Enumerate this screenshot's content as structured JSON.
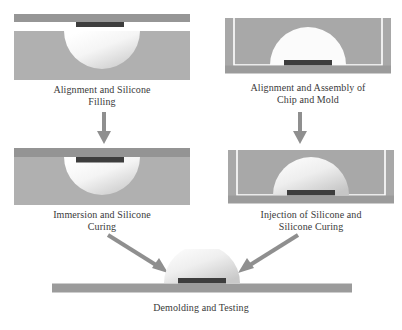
{
  "figure": {
    "type": "process-flow-diagram",
    "background_color": "#ffffff"
  },
  "palette": {
    "mold_gray": "#a6a6a6",
    "block_gray": "#b3b3b3",
    "bar_dark_gray": "#969696",
    "substrate_gray": "#9e9e9e",
    "chip_dark": "#3d3d3d",
    "lens_light": "#f2f2f2",
    "lens_shadow": "#cfcfcf",
    "outline_white": "#ffffff",
    "arrow_gray": "#8c8c8c",
    "caption_color": "#3a3a3a"
  },
  "steps": [
    {
      "id": "step-1",
      "position": "top-left",
      "caption_line1": "Alignment and Silicone",
      "caption_line2": "Filling",
      "elements": [
        "top-bar",
        "chip",
        "mold-block",
        "silicone-dome-cavity"
      ]
    },
    {
      "id": "step-2",
      "position": "top-right",
      "caption_line1": "Alignment and Assembly of",
      "caption_line2": "Chip and Mold",
      "elements": [
        "mold-block",
        "white-frame-outline",
        "dome-cavity",
        "chip",
        "substrate-bar"
      ]
    },
    {
      "id": "step-3",
      "position": "bottom-left",
      "caption_line1": "Immersion and Silicone",
      "caption_line2": "Curing",
      "elements": [
        "top-bar",
        "chip",
        "mold-block",
        "silicone-dome"
      ]
    },
    {
      "id": "step-4",
      "position": "bottom-right",
      "caption_line1": "Injection of Silicone and",
      "caption_line2": "Silicone Curing",
      "elements": [
        "mold-block",
        "white-frame-outline",
        "filled-dome",
        "chip",
        "substrate-bar"
      ]
    },
    {
      "id": "step-5",
      "position": "bottom-center",
      "caption_line1": "Demolding and Testing",
      "caption_line2": "",
      "elements": [
        "lens-dome",
        "chip",
        "substrate-bar"
      ]
    }
  ],
  "arrows": [
    {
      "id": "arrow-left-down",
      "direction": "down",
      "from": "step-1",
      "to": "step-3"
    },
    {
      "id": "arrow-right-down",
      "direction": "down",
      "from": "step-2",
      "to": "step-4"
    },
    {
      "id": "arrow-diagonal-left",
      "direction": "down-right",
      "from": "step-3",
      "to": "step-5"
    },
    {
      "id": "arrow-diagonal-right",
      "direction": "down-left",
      "from": "step-4",
      "to": "step-5"
    }
  ]
}
